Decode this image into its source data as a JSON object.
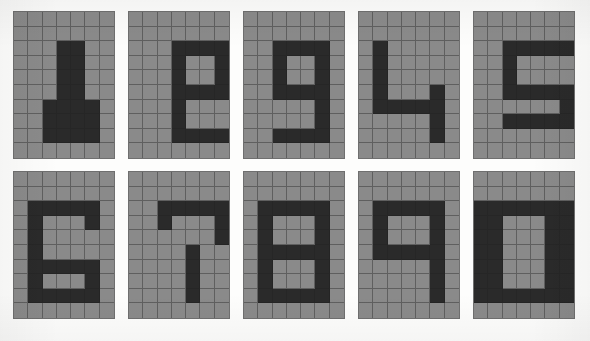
{
  "sheet": {
    "title": "Pixel digit grid sheet",
    "description": "Ten hand-shaded pixel digits on square grid paper, arranged five across and two down.",
    "columns": 5,
    "rows": 2,
    "panel_count": 10
  },
  "grid": {
    "cols": 7,
    "rows": 10,
    "cell_label": "grid-cell"
  },
  "colors": {
    "page_background": "#fdfdfc",
    "cell_light": "#8a8a8a",
    "cell_dark": "#2a2a2a",
    "grid_line": "#5f5f5f",
    "panel_border": "#6f6f6f"
  },
  "panels": [
    {
      "name": "digit-panel-1",
      "digit": "1",
      "position": "row 1, column 1",
      "filled_cells": [
        [
          2,
          3
        ],
        [
          2,
          4
        ],
        [
          3,
          3
        ],
        [
          3,
          4
        ],
        [
          4,
          3
        ],
        [
          4,
          4
        ],
        [
          5,
          3
        ],
        [
          5,
          4
        ],
        [
          6,
          2
        ],
        [
          6,
          3
        ],
        [
          6,
          4
        ],
        [
          6,
          5
        ],
        [
          7,
          2
        ],
        [
          7,
          3
        ],
        [
          7,
          4
        ],
        [
          7,
          5
        ],
        [
          8,
          2
        ],
        [
          8,
          3
        ],
        [
          8,
          4
        ],
        [
          8,
          5
        ]
      ]
    },
    {
      "name": "digit-panel-2",
      "digit": "2",
      "position": "row 1, column 2",
      "filled_cells": [
        [
          2,
          3
        ],
        [
          2,
          4
        ],
        [
          2,
          5
        ],
        [
          2,
          6
        ],
        [
          3,
          3
        ],
        [
          3,
          6
        ],
        [
          4,
          3
        ],
        [
          4,
          6
        ],
        [
          5,
          3
        ],
        [
          5,
          4
        ],
        [
          5,
          5
        ],
        [
          5,
          6
        ],
        [
          6,
          3
        ],
        [
          7,
          3
        ],
        [
          8,
          3
        ],
        [
          8,
          4
        ],
        [
          8,
          5
        ],
        [
          8,
          6
        ]
      ]
    },
    {
      "name": "digit-panel-3",
      "digit": "3",
      "position": "row 1, column 3",
      "filled_cells": [
        [
          2,
          2
        ],
        [
          2,
          3
        ],
        [
          2,
          4
        ],
        [
          2,
          5
        ],
        [
          3,
          2
        ],
        [
          3,
          5
        ],
        [
          4,
          2
        ],
        [
          4,
          5
        ],
        [
          5,
          2
        ],
        [
          5,
          3
        ],
        [
          5,
          4
        ],
        [
          5,
          5
        ],
        [
          6,
          5
        ],
        [
          7,
          5
        ],
        [
          8,
          2
        ],
        [
          8,
          3
        ],
        [
          8,
          4
        ],
        [
          8,
          5
        ]
      ]
    },
    {
      "name": "digit-panel-4",
      "digit": "4",
      "position": "row 1, column 4",
      "filled_cells": [
        [
          2,
          1
        ],
        [
          3,
          1
        ],
        [
          4,
          1
        ],
        [
          5,
          1
        ],
        [
          5,
          5
        ],
        [
          6,
          1
        ],
        [
          6,
          2
        ],
        [
          6,
          3
        ],
        [
          6,
          4
        ],
        [
          6,
          5
        ],
        [
          7,
          5
        ],
        [
          8,
          5
        ]
      ]
    },
    {
      "name": "digit-panel-5",
      "digit": "5",
      "position": "row 1, column 5",
      "filled_cells": [
        [
          2,
          2
        ],
        [
          2,
          3
        ],
        [
          2,
          4
        ],
        [
          2,
          5
        ],
        [
          2,
          6
        ],
        [
          3,
          2
        ],
        [
          4,
          2
        ],
        [
          5,
          2
        ],
        [
          5,
          3
        ],
        [
          5,
          4
        ],
        [
          5,
          5
        ],
        [
          5,
          6
        ],
        [
          6,
          6
        ],
        [
          7,
          2
        ],
        [
          7,
          3
        ],
        [
          7,
          4
        ],
        [
          7,
          5
        ],
        [
          7,
          6
        ]
      ]
    },
    {
      "name": "digit-panel-6",
      "digit": "6",
      "position": "row 2, column 1",
      "filled_cells": [
        [
          2,
          1
        ],
        [
          2,
          2
        ],
        [
          2,
          3
        ],
        [
          2,
          4
        ],
        [
          2,
          5
        ],
        [
          3,
          1
        ],
        [
          3,
          5
        ],
        [
          4,
          1
        ],
        [
          5,
          1
        ],
        [
          6,
          1
        ],
        [
          6,
          2
        ],
        [
          6,
          3
        ],
        [
          6,
          4
        ],
        [
          6,
          5
        ],
        [
          7,
          1
        ],
        [
          7,
          5
        ],
        [
          8,
          1
        ],
        [
          8,
          2
        ],
        [
          8,
          3
        ],
        [
          8,
          4
        ],
        [
          8,
          5
        ]
      ]
    },
    {
      "name": "digit-panel-7",
      "digit": "7",
      "position": "row 2, column 2",
      "filled_cells": [
        [
          2,
          2
        ],
        [
          2,
          3
        ],
        [
          2,
          4
        ],
        [
          2,
          5
        ],
        [
          2,
          6
        ],
        [
          3,
          2
        ],
        [
          3,
          6
        ],
        [
          4,
          6
        ],
        [
          5,
          4
        ],
        [
          6,
          4
        ],
        [
          7,
          4
        ],
        [
          8,
          4
        ]
      ]
    },
    {
      "name": "digit-panel-8",
      "digit": "8",
      "position": "row 2, column 3",
      "filled_cells": [
        [
          2,
          1
        ],
        [
          2,
          2
        ],
        [
          2,
          3
        ],
        [
          2,
          4
        ],
        [
          2,
          5
        ],
        [
          3,
          1
        ],
        [
          3,
          5
        ],
        [
          4,
          1
        ],
        [
          4,
          5
        ],
        [
          5,
          1
        ],
        [
          5,
          2
        ],
        [
          5,
          3
        ],
        [
          5,
          4
        ],
        [
          5,
          5
        ],
        [
          6,
          1
        ],
        [
          6,
          5
        ],
        [
          7,
          1
        ],
        [
          7,
          5
        ],
        [
          8,
          1
        ],
        [
          8,
          2
        ],
        [
          8,
          3
        ],
        [
          8,
          4
        ],
        [
          8,
          5
        ]
      ]
    },
    {
      "name": "digit-panel-9",
      "digit": "9",
      "position": "row 2, column 4",
      "filled_cells": [
        [
          2,
          1
        ],
        [
          2,
          2
        ],
        [
          2,
          3
        ],
        [
          2,
          4
        ],
        [
          2,
          5
        ],
        [
          3,
          1
        ],
        [
          3,
          5
        ],
        [
          4,
          1
        ],
        [
          4,
          5
        ],
        [
          5,
          1
        ],
        [
          5,
          2
        ],
        [
          5,
          3
        ],
        [
          5,
          4
        ],
        [
          5,
          5
        ],
        [
          6,
          5
        ],
        [
          7,
          5
        ],
        [
          8,
          5
        ]
      ]
    },
    {
      "name": "digit-panel-0",
      "digit": "0",
      "position": "row 2, column 5",
      "filled_cells": [
        [
          2,
          0
        ],
        [
          2,
          1
        ],
        [
          2,
          2
        ],
        [
          2,
          3
        ],
        [
          2,
          4
        ],
        [
          2,
          5
        ],
        [
          2,
          6
        ],
        [
          3,
          0
        ],
        [
          3,
          1
        ],
        [
          3,
          5
        ],
        [
          3,
          6
        ],
        [
          4,
          0
        ],
        [
          4,
          1
        ],
        [
          4,
          5
        ],
        [
          4,
          6
        ],
        [
          5,
          0
        ],
        [
          5,
          1
        ],
        [
          5,
          5
        ],
        [
          5,
          6
        ],
        [
          6,
          0
        ],
        [
          6,
          1
        ],
        [
          6,
          5
        ],
        [
          6,
          6
        ],
        [
          7,
          0
        ],
        [
          7,
          1
        ],
        [
          7,
          5
        ],
        [
          7,
          6
        ],
        [
          8,
          0
        ],
        [
          8,
          1
        ],
        [
          8,
          2
        ],
        [
          8,
          3
        ],
        [
          8,
          4
        ],
        [
          8,
          5
        ],
        [
          8,
          6
        ]
      ]
    }
  ]
}
